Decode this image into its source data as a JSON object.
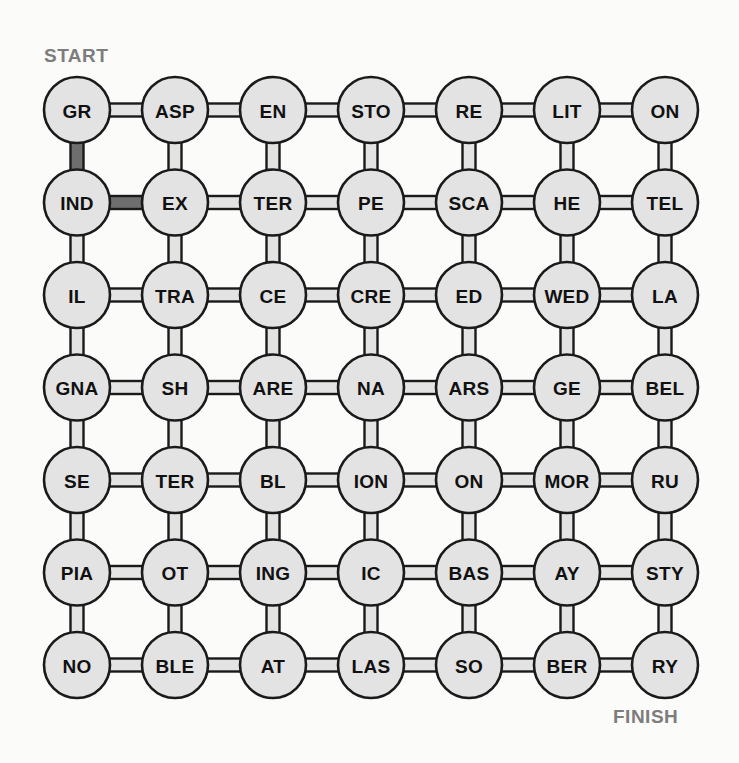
{
  "puzzle": {
    "title": "Word chain grid puzzle",
    "start_label": "START",
    "finish_label": "FINISH",
    "rows": 7,
    "cols": 7,
    "colors": {
      "background": "#fbfbf9",
      "node_fill": "#e3e3e3",
      "node_stroke": "#1a1a1a",
      "edge_fill": "#e3e3e3",
      "edge_highlight_fill": "#6e6e6e",
      "label_text": "#7d7d7d",
      "node_text": "#111111"
    },
    "geometry": {
      "origin_x": 77,
      "origin_y": 110,
      "col_spacing": 98,
      "row_spacing": 92.5,
      "node_radius": 33,
      "connector_thickness": 13
    },
    "grid": [
      [
        "GR",
        "ASP",
        "EN",
        "STO",
        "RE",
        "LIT",
        "ON"
      ],
      [
        "IND",
        "EX",
        "TER",
        "PE",
        "SCA",
        "HE",
        "TEL"
      ],
      [
        "IL",
        "TRA",
        "CE",
        "CRE",
        "ED",
        "WED",
        "LA"
      ],
      [
        "GNA",
        "SH",
        "ARE",
        "NA",
        "ARS",
        "GE",
        "BEL"
      ],
      [
        "SE",
        "TER",
        "BL",
        "ION",
        "ON",
        "MOR",
        "RU"
      ],
      [
        "PIA",
        "OT",
        "ING",
        "IC",
        "BAS",
        "AY",
        "STY"
      ],
      [
        "NO",
        "BLE",
        "AT",
        "LAS",
        "SO",
        "BER",
        "RY"
      ]
    ],
    "horizontal_edges": [
      [
        true,
        true,
        true,
        true,
        true,
        true
      ],
      [
        true,
        true,
        true,
        true,
        true,
        true
      ],
      [
        true,
        true,
        true,
        true,
        true,
        true
      ],
      [
        true,
        true,
        true,
        true,
        true,
        true
      ],
      [
        true,
        true,
        true,
        true,
        true,
        true
      ],
      [
        true,
        true,
        true,
        true,
        true,
        true
      ],
      [
        true,
        true,
        true,
        true,
        true,
        true
      ]
    ],
    "vertical_edges": [
      [
        true,
        true,
        true,
        true,
        true,
        true,
        true
      ],
      [
        true,
        true,
        true,
        true,
        true,
        true,
        true
      ],
      [
        true,
        true,
        true,
        true,
        true,
        true,
        true
      ],
      [
        true,
        true,
        true,
        true,
        true,
        true,
        true
      ],
      [
        true,
        true,
        true,
        true,
        true,
        true,
        true
      ],
      [
        true,
        true,
        true,
        true,
        true,
        true,
        true
      ]
    ],
    "highlighted_edges": [
      {
        "type": "vertical",
        "row": 0,
        "col": 0,
        "from": "GR",
        "to": "IND"
      },
      {
        "type": "horizontal",
        "row": 1,
        "col": 0,
        "from": "IND",
        "to": "EX"
      }
    ]
  }
}
